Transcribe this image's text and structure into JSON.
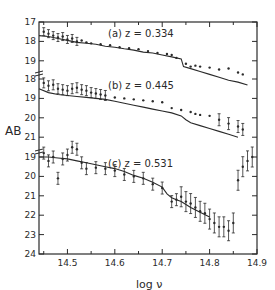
{
  "chart_data": {
    "type": "scatter",
    "title": "",
    "xlabel": "log ν",
    "ylabel": "AB",
    "xlim": [
      14.44,
      14.9
    ],
    "x_ticks": [
      14.5,
      14.6,
      14.7,
      14.8,
      14.9
    ],
    "x_tick_labels": [
      "14.5",
      "14.6",
      "14.7",
      "14.8",
      "14.9"
    ],
    "grid": false,
    "legend": "none",
    "panels": [
      {
        "id": "a",
        "label": "(a)  z = 0.334",
        "redshift": 0.334,
        "y_ticks": [
          17,
          18,
          19
        ],
        "y_tick_labels": [
          "17",
          "18",
          "19"
        ],
        "ylim": [
          17,
          19.2
        ],
        "model_curve": {
          "x": [
            14.44,
            14.46,
            14.48,
            14.5,
            14.52,
            14.54,
            14.56,
            14.58,
            14.6,
            14.62,
            14.64,
            14.66,
            14.68,
            14.7,
            14.72,
            14.74,
            14.745,
            14.76,
            14.78,
            14.8,
            14.82,
            14.84,
            14.86,
            14.88
          ],
          "y": [
            17.7,
            17.75,
            17.85,
            17.95,
            18.05,
            18.1,
            18.15,
            18.25,
            18.3,
            18.38,
            18.45,
            18.55,
            18.6,
            18.7,
            18.8,
            18.9,
            19.3,
            19.4,
            19.55,
            19.7,
            19.85,
            20.0,
            20.1,
            20.25
          ]
        },
        "points": {
          "x": [
            14.45,
            14.46,
            14.47,
            14.48,
            14.49,
            14.5,
            14.51,
            14.52,
            14.53,
            14.54,
            14.55,
            14.57,
            14.59,
            14.61,
            14.63,
            14.65,
            14.67,
            14.69,
            14.71,
            14.72,
            14.73,
            14.75,
            14.76,
            14.77,
            14.78,
            14.8,
            14.82,
            14.84,
            14.86,
            14.87
          ],
          "y": [
            17.5,
            17.6,
            17.7,
            17.8,
            17.75,
            17.9,
            17.85,
            18.0,
            17.95,
            18.05,
            18.1,
            18.15,
            18.2,
            18.3,
            18.35,
            18.4,
            18.5,
            18.6,
            18.65,
            18.7,
            18.85,
            19.15,
            19.3,
            19.25,
            19.3,
            19.35,
            19.45,
            19.4,
            19.6,
            19.7
          ]
        }
      },
      {
        "id": "b",
        "label": "(b)  z = 0.445",
        "redshift": 0.445,
        "y_ticks": [
          18,
          19,
          20,
          21
        ],
        "y_tick_labels": [
          "18",
          "19",
          "20",
          "21"
        ],
        "ylim": [
          18,
          21
        ],
        "model_curve": {
          "x": [
            14.44,
            14.46,
            14.48,
            14.5,
            14.52,
            14.54,
            14.56,
            14.58,
            14.6,
            14.62,
            14.64,
            14.66,
            14.68,
            14.7,
            14.72,
            14.74,
            14.75,
            14.76,
            14.78,
            14.8,
            14.82,
            14.84,
            14.86
          ],
          "y": [
            18.5,
            18.7,
            18.8,
            18.85,
            18.9,
            18.95,
            19.0,
            19.05,
            19.15,
            19.25,
            19.35,
            19.45,
            19.55,
            19.65,
            19.75,
            19.9,
            20.1,
            20.25,
            20.4,
            20.55,
            20.7,
            20.85,
            21.0
          ]
        },
        "points": {
          "x": [
            14.45,
            14.46,
            14.47,
            14.48,
            14.49,
            14.5,
            14.51,
            14.52,
            14.53,
            14.54,
            14.55,
            14.56,
            14.57,
            14.58,
            14.6,
            14.62,
            14.64,
            14.66,
            14.68,
            14.7,
            14.72,
            14.74,
            14.76,
            14.77,
            14.78,
            14.8,
            14.82,
            14.84,
            14.86,
            14.87
          ],
          "y": [
            18.2,
            18.35,
            18.3,
            18.5,
            18.55,
            18.6,
            18.5,
            18.45,
            18.55,
            18.6,
            18.7,
            18.75,
            18.8,
            18.85,
            18.95,
            19.0,
            19.05,
            19.1,
            19.15,
            19.2,
            19.5,
            19.6,
            19.7,
            19.8,
            19.85,
            19.9,
            20.1,
            20.3,
            20.45,
            20.6
          ]
        }
      },
      {
        "id": "c",
        "label": "(c)  z = 0.531",
        "redshift": 0.531,
        "y_ticks": [
          19,
          20,
          21,
          22,
          23,
          24
        ],
        "y_tick_labels": [
          "19",
          "20",
          "21",
          "22",
          "23",
          "24"
        ],
        "ylim": [
          18.7,
          24
        ],
        "model_curve": {
          "x": [
            14.44,
            14.46,
            14.48,
            14.5,
            14.52,
            14.54,
            14.56,
            14.58,
            14.6,
            14.62,
            14.64,
            14.66,
            14.68,
            14.7,
            14.71,
            14.72,
            14.73,
            14.74,
            14.76,
            14.78,
            14.8
          ],
          "y": [
            19.0,
            19.0,
            19.05,
            19.1,
            19.2,
            19.3,
            19.4,
            19.5,
            19.6,
            19.75,
            19.95,
            20.1,
            20.3,
            20.55,
            20.9,
            21.1,
            21.2,
            21.3,
            21.6,
            21.85,
            22.1
          ]
        },
        "points": {
          "x": [
            14.45,
            14.46,
            14.47,
            14.48,
            14.49,
            14.5,
            14.51,
            14.52,
            14.53,
            14.54,
            14.56,
            14.58,
            14.6,
            14.62,
            14.64,
            14.66,
            14.68,
            14.7,
            14.72,
            14.73,
            14.74,
            14.75,
            14.76,
            14.77,
            14.78,
            14.79,
            14.8,
            14.81,
            14.82,
            14.83,
            14.84,
            14.85,
            14.86,
            14.87,
            14.88,
            14.89
          ],
          "y": [
            18.8,
            19.2,
            19.0,
            20.1,
            19.1,
            18.9,
            18.5,
            18.6,
            19.3,
            19.6,
            19.55,
            19.6,
            19.7,
            19.9,
            20.0,
            20.1,
            20.4,
            20.6,
            21.3,
            21.2,
            21.05,
            21.3,
            21.4,
            21.6,
            21.8,
            21.9,
            22.2,
            22.4,
            22.6,
            22.6,
            22.8,
            22.4,
            20.2,
            19.5,
            19.2,
            19.0
          ]
        }
      }
    ]
  },
  "axis": {
    "ylabel": "AB",
    "xlabel": "log ν"
  }
}
